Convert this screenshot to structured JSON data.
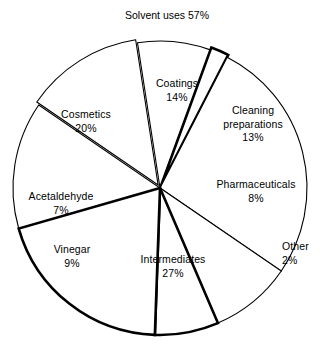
{
  "chart_data": {
    "type": "pie",
    "title": "Solvent uses 57%",
    "xlabel": "",
    "ylabel": "",
    "units": "percent",
    "legend": "none",
    "grid": false,
    "categories": [
      "Coatings",
      "Cleaning preparations",
      "Pharmaceuticals",
      "Other",
      "Intermediates",
      "Vinegar",
      "Acetaldehyde",
      "Cosmetics"
    ],
    "values": [
      14,
      13,
      8,
      2,
      27,
      9,
      7,
      20
    ],
    "total": 100,
    "annotations": [
      "Solvent uses 57% spans Coatings, Cleaning preparations, Cosmetics and Other"
    ],
    "slices": [
      {
        "label": "Coatings",
        "value": 14,
        "pct_text": "14%",
        "label_lines": [
          "Coatings"
        ]
      },
      {
        "label": "Cleaning preparations",
        "value": 13,
        "pct_text": "13%",
        "label_lines": [
          "Cleaning",
          "preparations"
        ]
      },
      {
        "label": "Pharmaceuticals",
        "value": 8,
        "pct_text": "8%",
        "label_lines": [
          "Pharmaceuticals"
        ]
      },
      {
        "label": "Other",
        "value": 2,
        "pct_text": "2%",
        "label_lines": [
          "Other"
        ]
      },
      {
        "label": "Intermediates",
        "value": 27,
        "pct_text": "27%",
        "label_lines": [
          "Intermediates"
        ]
      },
      {
        "label": "Vinegar",
        "value": 9,
        "pct_text": "9%",
        "label_lines": [
          "Vinegar"
        ]
      },
      {
        "label": "Acetaldehyde",
        "value": 7,
        "pct_text": "7%",
        "label_lines": [
          "Acetaldehyde"
        ]
      },
      {
        "label": "Cosmetics",
        "value": 20,
        "pct_text": "20%",
        "label_lines": [
          "Cosmetics"
        ]
      }
    ]
  },
  "labels": {
    "title": "Solvent uses 57%",
    "coatings_name": "Coatings",
    "coatings_pct": "14%",
    "cleaning_name_line1": "Cleaning",
    "cleaning_name_line2": "preparations",
    "cleaning_pct": "13%",
    "pharmaceuticals_name": "Pharmaceuticals",
    "pharmaceuticals_pct": "8%",
    "other_name": "Other",
    "other_pct": "2%",
    "intermediates_name": "Intermediates",
    "intermediates_pct": "27%",
    "vinegar_name": "Vinegar",
    "vinegar_pct": "9%",
    "acetaldehyde_name": "Acetaldehyde",
    "acetaldehyde_pct": "7%",
    "cosmetics_name": "Cosmetics",
    "cosmetics_pct": "20%"
  },
  "style": {
    "stroke_color": "#000000",
    "fill_color": "#ffffff",
    "background": "#ffffff"
  },
  "geometry": {
    "center_x": 160,
    "center_y": 188,
    "radius": 147,
    "start_angle_deg": -106,
    "direction": "clockwise"
  }
}
